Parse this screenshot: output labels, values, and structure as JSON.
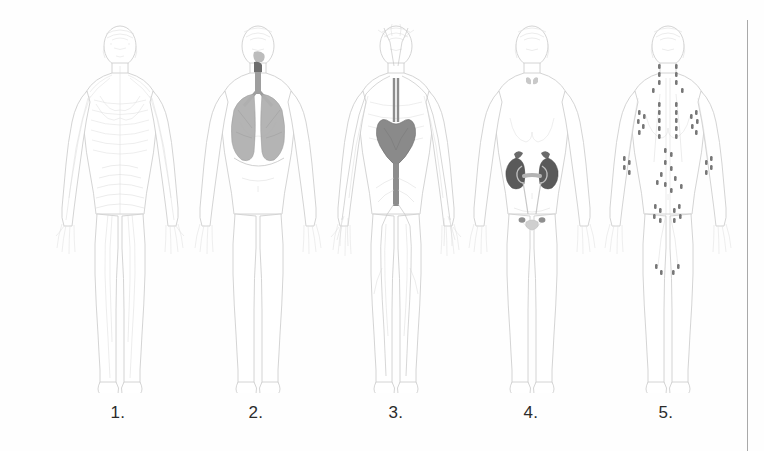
{
  "page": {
    "background_color": "#fefefe",
    "width": 764,
    "height": 451
  },
  "divider": {
    "name": "right-vertical-rule",
    "color": "#a9a9a9",
    "x": 747,
    "y_start": 20,
    "y_end": 451
  },
  "figures": [
    {
      "number": "1.",
      "caption": "1.",
      "system": "muscular-nervous-system",
      "organ_highlight": "none",
      "highlight_color": "#e2e2e2",
      "x": 50
    },
    {
      "number": "2.",
      "caption": "2.",
      "system": "respiratory-system",
      "organ_highlight": "lungs-trachea-larynx",
      "highlight_color": "#b0b0b0",
      "x": 188
    },
    {
      "number": "3.",
      "caption": "3.",
      "system": "circulatory-system",
      "organ_highlight": "heart-aorta-arteries",
      "highlight_color": "#8a8a8a",
      "x": 326
    },
    {
      "number": "4.",
      "caption": "4.",
      "system": "urinary-system",
      "organ_highlight": "kidneys-ureters-bladder",
      "highlight_color": "#5a5a5a",
      "x": 462
    },
    {
      "number": "5.",
      "caption": "5.",
      "system": "lymphatic-system",
      "organ_highlight": "lymph-nodes-vessels",
      "highlight_color": "#707070",
      "x": 598
    }
  ],
  "captions": {
    "one": "1.",
    "two": "2.",
    "three": "3.",
    "four": "4.",
    "five": "5."
  },
  "caption_positions": {
    "one": 98,
    "two": 236,
    "three": 376,
    "four": 511,
    "five": 646
  }
}
